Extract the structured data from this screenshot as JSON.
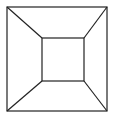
{
  "diagram": {
    "stroke_color": "#222222",
    "background": "#ffffff",
    "outer_square": {
      "x1": 7,
      "y1": 7,
      "x2": 107,
      "y2": 111
    },
    "inner_square": {
      "x1": 42,
      "y1": 38,
      "x2": 84,
      "y2": 81
    }
  }
}
